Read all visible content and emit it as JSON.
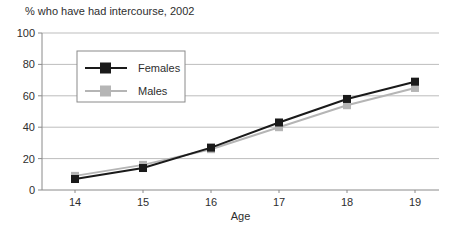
{
  "chart_data": {
    "type": "line",
    "title": "% who have had intercourse, 2002",
    "xlabel": "Age",
    "ylabel": "",
    "x": [
      14,
      15,
      16,
      17,
      18,
      19
    ],
    "series": [
      {
        "name": "Females",
        "color": "#1a1a1a",
        "values": [
          7,
          14,
          27,
          43,
          58,
          69
        ]
      },
      {
        "name": "Males",
        "color": "#b5b5b5",
        "values": [
          9,
          16,
          26,
          40,
          54,
          65
        ]
      }
    ],
    "ylim": [
      0,
      100
    ],
    "yticks": [
      0,
      20,
      40,
      60,
      80,
      100
    ],
    "grid": true,
    "legend_position": "upper-left-inside",
    "colors": {
      "gridline": "#bdbdbd",
      "axis": "#8a8a8a",
      "text": "#2e2e2e",
      "legend_border": "#8a8a8a",
      "background": "#ffffff"
    }
  }
}
